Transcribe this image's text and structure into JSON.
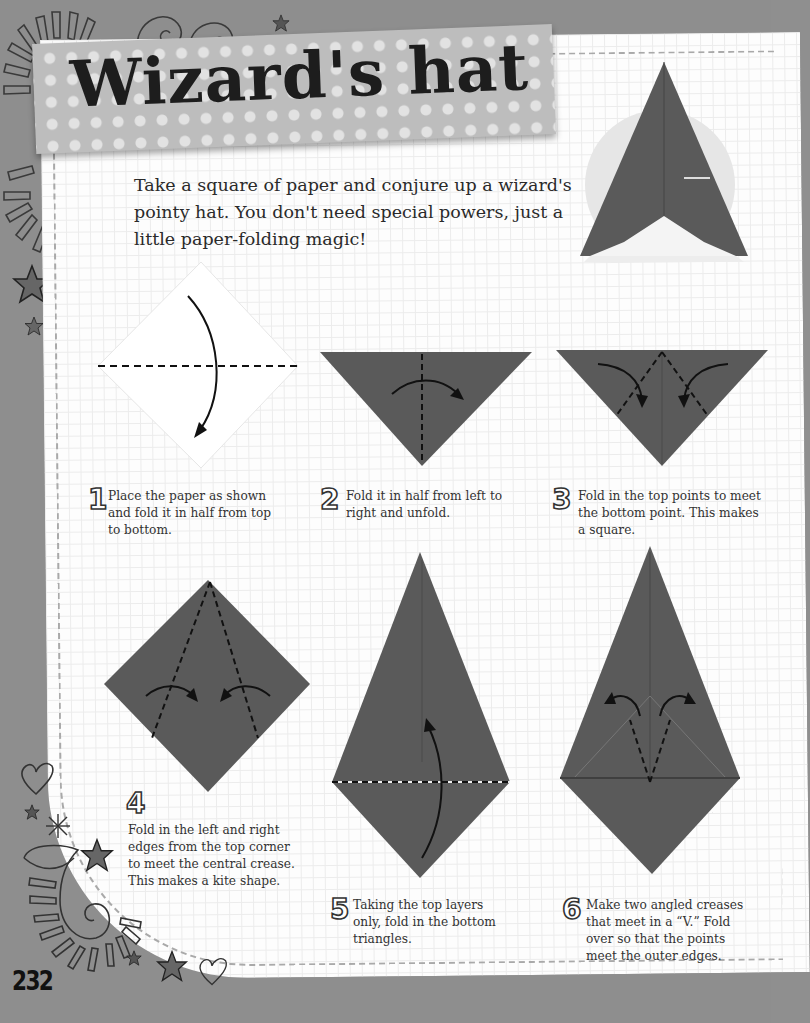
{
  "page": {
    "title": "Wizard's hat",
    "intro": "Take a square of paper and conjure up a wizard's pointy hat. You don't need special powers, just a little paper-folding magic!",
    "page_number": "232"
  },
  "colors": {
    "background": "#8e8e8e",
    "paper": "#fdfdfd",
    "grid": "#ececec",
    "banner": "#bdbdbd",
    "banner_dots": "#e2e2e2",
    "origami_dark": "#5a5a5a",
    "origami_light": "#f4f4f4",
    "text": "#333333"
  },
  "steps": [
    {
      "number": "1",
      "text": "Place the paper as shown and fold it in half from top to bottom."
    },
    {
      "number": "2",
      "text": "Fold it in half from left to right and unfold."
    },
    {
      "number": "3",
      "text": "Fold in the top points to meet the bottom point. This makes a square."
    },
    {
      "number": "4",
      "text": "Fold in the left and right edges from the top corner to meet the central crease. This makes a kite shape."
    },
    {
      "number": "5",
      "text": "Taking the top layers only, fold in the bottom triangles."
    },
    {
      "number": "6",
      "text": "Make two angled creases that meet in a “V.” Fold over so that the points meet the outer edges."
    }
  ],
  "decorations": [
    "sunburst-icon",
    "spiral-icon",
    "star-icon",
    "heart-icon",
    "asterisk-icon",
    "paisley-icon"
  ]
}
